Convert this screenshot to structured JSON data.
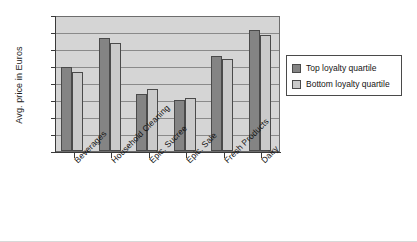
{
  "chart_data": {
    "type": "bar",
    "title": "",
    "xlabel": "",
    "ylabel": "Avg. price in Euros",
    "ylim": [
      0,
      4
    ],
    "ytick_step": 0.5,
    "yticks": [
      "4",
      "3.5",
      "3",
      "2.5",
      "2",
      "1.5",
      "1",
      "0.5",
      "0"
    ],
    "grid": true,
    "legend_position": "right",
    "categories": [
      "Beverages",
      "Household Cleaning",
      "Epic. Sucree",
      "Epic. Sale",
      "Fresh Products",
      "Dairy"
    ],
    "series": [
      {
        "name": "Top loyalty quartile",
        "color": "#848484",
        "values": [
          2.47,
          3.32,
          1.67,
          1.5,
          2.78,
          3.57
        ]
      },
      {
        "name": "Bottom loyalty quartile",
        "color": "#cacaca",
        "values": [
          2.33,
          3.17,
          1.82,
          1.57,
          2.72,
          3.42
        ]
      }
    ]
  },
  "legend": {
    "entries": [
      {
        "label": "Top loyalty quartile",
        "color": "#848484"
      },
      {
        "label": "Bottom loyalty quartile",
        "color": "#cacaca"
      }
    ]
  },
  "colors": {
    "plot_background": "#d5d5d5",
    "gridline": "#8a8a8a",
    "axis": "#3a3a3a",
    "bar_top_quartile": "#848484",
    "bar_bottom_quartile": "#cacaca"
  }
}
